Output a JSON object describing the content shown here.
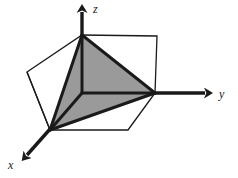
{
  "figure": {
    "type": "3d-geometry-diagram",
    "background_color": "#ffffff",
    "axes": {
      "origin": {
        "x": 82,
        "y": 93
      },
      "items": [
        {
          "name": "z",
          "label": "z",
          "direction": "up",
          "line": {
            "x1": 82,
            "y1": 93,
            "x2": 82,
            "y2": 12
          },
          "arrow_tip": {
            "x": 82,
            "y": 4
          },
          "label_pos": {
            "x": 93,
            "y": 3
          }
        },
        {
          "name": "y",
          "label": "y",
          "direction": "right",
          "line": {
            "x1": 82,
            "y1": 93,
            "x2": 205,
            "y2": 93
          },
          "arrow_tip": {
            "x": 214,
            "y": 93
          },
          "label_pos": {
            "x": 219,
            "y": 88
          }
        },
        {
          "name": "x",
          "label": "x",
          "direction": "down-left",
          "line": {
            "x1": 82,
            "y1": 93,
            "x2": 27,
            "y2": 155
          },
          "arrow_tip": {
            "x": 20,
            "y": 163
          },
          "label_pos": {
            "x": 8,
            "y": 159
          }
        }
      ]
    },
    "cube": {
      "stroke_color": "#1a1a1a",
      "stroke_width": 1.2,
      "fill": "none",
      "vertices": {
        "origin": {
          "x": 82,
          "y": 93
        },
        "front_bottom_left": {
          "x": 50,
          "y": 130
        },
        "right_mid": {
          "x": 155,
          "y": 93
        },
        "top_center": {
          "x": 82,
          "y": 35
        },
        "top_right": {
          "x": 157,
          "y": 36
        },
        "left_mid": {
          "x": 27,
          "y": 72
        },
        "left_top": {
          "x": 27,
          "y": 72
        },
        "bottom_right": {
          "x": 128,
          "y": 130
        },
        "back_top_left": {
          "x": 82,
          "y": 35
        }
      },
      "outline_path": "M 27,72 L 82,35 L 157,36 L 155,93 L 128,130 L 50,130 Z",
      "inner_edges": [
        {
          "x1": 82,
          "y1": 93,
          "x2": 155,
          "y2": 93
        },
        {
          "x1": 82,
          "y1": 93,
          "x2": 50,
          "y2": 130
        },
        {
          "x1": 82,
          "y1": 93,
          "x2": 82,
          "y2": 35
        },
        {
          "x1": 27,
          "y1": 72,
          "x2": 50,
          "y2": 130
        }
      ]
    },
    "tetrahedron": {
      "fill_color": "#9a9a9a",
      "stroke_color": "#1a1a1a",
      "stroke_width": 3,
      "vertices": [
        {
          "name": "apex-z",
          "x": 82,
          "y": 35
        },
        {
          "name": "right-y",
          "x": 155,
          "y": 93
        },
        {
          "name": "front-x",
          "x": 50,
          "y": 130
        },
        {
          "name": "origin",
          "x": 82,
          "y": 93
        }
      ],
      "faces": [
        {
          "name": "right-face",
          "path": "M 82,35 L 155,93 L 82,93 Z"
        },
        {
          "name": "front-face",
          "path": "M 82,35 L 82,93 L 50,130 Z"
        },
        {
          "name": "bottom-face",
          "path": "M 82,93 L 155,93 L 50,130 Z"
        }
      ],
      "edges": [
        {
          "name": "apex-to-right",
          "x1": 82,
          "y1": 35,
          "x2": 155,
          "y2": 93
        },
        {
          "name": "apex-to-front",
          "x1": 82,
          "y1": 35,
          "x2": 50,
          "y2": 130
        },
        {
          "name": "apex-to-origin",
          "x1": 82,
          "y1": 35,
          "x2": 82,
          "y2": 93
        },
        {
          "name": "origin-to-right",
          "x1": 82,
          "y1": 93,
          "x2": 155,
          "y2": 93
        },
        {
          "name": "origin-to-front",
          "x1": 82,
          "y1": 93,
          "x2": 50,
          "y2": 130
        },
        {
          "name": "right-to-front",
          "x1": 155,
          "y1": 93,
          "x2": 50,
          "y2": 130
        }
      ]
    }
  },
  "chart_data": {
    "type": "diagram",
    "title": "",
    "xlabel": "x",
    "ylabel": "y",
    "zlabel": "z"
  }
}
